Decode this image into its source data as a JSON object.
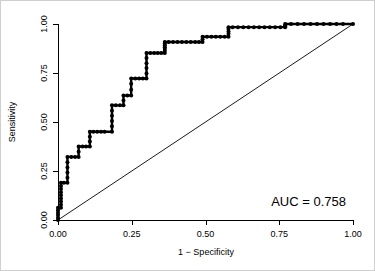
{
  "chart_data": {
    "type": "line",
    "title": "",
    "xlabel": "1 − Specificity",
    "ylabel": "Sensitivity",
    "xlim": [
      0.0,
      1.0
    ],
    "ylim": [
      0.0,
      1.0
    ],
    "grid": false,
    "legend": "none",
    "xticks": [
      "0.00",
      "0.25",
      "0.50",
      "0.75",
      "1.00"
    ],
    "xtickvalues": [
      0.0,
      0.25,
      0.5,
      0.75,
      1.0
    ],
    "yticks": [
      "0.00",
      "0.25",
      "0.50",
      "0.75",
      "1.00"
    ],
    "ytickvalues": [
      0.0,
      0.25,
      0.5,
      0.75,
      1.0
    ],
    "annotations": [
      {
        "text": "AUC = 0.758",
        "x": 0.86,
        "y": 0.095
      }
    ],
    "series": [
      {
        "name": "ROC curve",
        "style": "step-with-markers",
        "marker": "filled-circle",
        "color": "#000000",
        "x": [
          0.0,
          0.0,
          0.0,
          0.0,
          0.0,
          0.0,
          0.01,
          0.01,
          0.01,
          0.01,
          0.01,
          0.01,
          0.01,
          0.01,
          0.01,
          0.02,
          0.02,
          0.02,
          0.02,
          0.032,
          0.032,
          0.032,
          0.032,
          0.032,
          0.032,
          0.045,
          0.058,
          0.07,
          0.07,
          0.07,
          0.07,
          0.083,
          0.095,
          0.108,
          0.108,
          0.108,
          0.108,
          0.108,
          0.12,
          0.12,
          0.12,
          0.133,
          0.146,
          0.158,
          0.183,
          0.183,
          0.183,
          0.183,
          0.183,
          0.183,
          0.196,
          0.21,
          0.222,
          0.222,
          0.222,
          0.222,
          0.235,
          0.248,
          0.248,
          0.248,
          0.248,
          0.248,
          0.262,
          0.275,
          0.288,
          0.3,
          0.3,
          0.3,
          0.3,
          0.3,
          0.3,
          0.3,
          0.313,
          0.326,
          0.338,
          0.35,
          0.362,
          0.362,
          0.362,
          0.362,
          0.362,
          0.362,
          0.362,
          0.375,
          0.39,
          0.405,
          0.42,
          0.435,
          0.45,
          0.465,
          0.478,
          0.49,
          0.49,
          0.49,
          0.505,
          0.52,
          0.535,
          0.55,
          0.55,
          0.55,
          0.55,
          0.565,
          0.578,
          0.578,
          0.578,
          0.578,
          0.578,
          0.592,
          0.61,
          0.628,
          0.646,
          0.664,
          0.682,
          0.7,
          0.718,
          0.736,
          0.754,
          0.77,
          0.77,
          0.77,
          0.77,
          0.79,
          0.812,
          0.834,
          0.856,
          0.878,
          0.9,
          0.922,
          0.944,
          0.966,
          1.0
        ],
        "y": [
          0.0,
          0.012,
          0.025,
          0.037,
          0.05,
          0.062,
          0.062,
          0.078,
          0.094,
          0.11,
          0.126,
          0.142,
          0.158,
          0.174,
          0.19,
          0.19,
          0.19,
          0.19,
          0.19,
          0.19,
          0.215,
          0.242,
          0.268,
          0.295,
          0.322,
          0.322,
          0.322,
          0.322,
          0.322,
          0.348,
          0.375,
          0.375,
          0.375,
          0.375,
          0.375,
          0.4,
          0.425,
          0.45,
          0.45,
          0.45,
          0.45,
          0.45,
          0.45,
          0.45,
          0.45,
          0.478,
          0.505,
          0.532,
          0.558,
          0.585,
          0.585,
          0.585,
          0.585,
          0.585,
          0.61,
          0.635,
          0.635,
          0.635,
          0.635,
          0.665,
          0.695,
          0.722,
          0.722,
          0.722,
          0.722,
          0.722,
          0.722,
          0.748,
          0.775,
          0.8,
          0.826,
          0.852,
          0.852,
          0.852,
          0.852,
          0.852,
          0.852,
          0.862,
          0.872,
          0.882,
          0.892,
          0.9,
          0.908,
          0.908,
          0.908,
          0.908,
          0.908,
          0.908,
          0.908,
          0.908,
          0.908,
          0.908,
          0.922,
          0.935,
          0.935,
          0.935,
          0.935,
          0.935,
          0.935,
          0.935,
          0.935,
          0.935,
          0.935,
          0.95,
          0.962,
          0.974,
          0.984,
          0.984,
          0.984,
          0.984,
          0.984,
          0.984,
          0.984,
          0.984,
          0.984,
          0.984,
          0.984,
          0.984,
          0.988,
          0.992,
          1.0,
          1.0,
          1.0,
          1.0,
          1.0,
          1.0,
          1.0,
          1.0,
          1.0,
          1.0,
          1.0
        ]
      },
      {
        "name": "Reference diagonal",
        "style": "line",
        "marker": "none",
        "color": "#000000",
        "x": [
          0.0,
          1.0
        ],
        "y": [
          0.0,
          1.0
        ]
      }
    ]
  },
  "figure": {
    "background_color": "#ffffff",
    "foreground_color": "#000000",
    "border_color": "#cfcfcf"
  }
}
